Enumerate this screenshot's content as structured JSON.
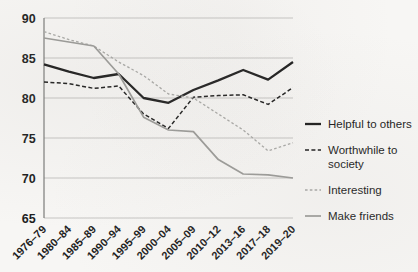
{
  "chart_data": {
    "type": "line",
    "title": "",
    "subtitle": "",
    "xlabel": "",
    "ylabel": "",
    "ylim": [
      65,
      90
    ],
    "yticks": [
      65,
      70,
      75,
      80,
      85,
      90
    ],
    "grid": true,
    "legend_position": "right",
    "categories": [
      "1976–79",
      "1980–84",
      "1985–89",
      "1990–94",
      "1995–99",
      "2000–04",
      "2005–09",
      "2010–12",
      "2013–16",
      "2017–18",
      "2019–20"
    ],
    "series": [
      {
        "name": "Helpful to others",
        "style": "solid",
        "color": "#1a1a1a",
        "width": 2.3,
        "values": [
          84.2,
          83.3,
          82.5,
          83.0,
          80.0,
          79.4,
          81.0,
          82.2,
          83.5,
          82.3,
          84.5
        ]
      },
      {
        "name": "Worthwhile to society",
        "style": "dashed",
        "color": "#1a1a1a",
        "width": 1.5,
        "values": [
          82.0,
          81.8,
          81.2,
          81.5,
          78.0,
          76.2,
          80.1,
          80.3,
          80.4,
          79.2,
          81.3
        ]
      },
      {
        "name": "Interesting",
        "style": "dotted",
        "color": "#a8a8a5",
        "width": 1.3,
        "values": [
          88.3,
          87.3,
          86.5,
          84.5,
          82.8,
          80.5,
          80.0,
          78.0,
          76.0,
          73.4,
          74.4
        ]
      },
      {
        "name": "Make friends",
        "style": "solid",
        "color": "#9a9a97",
        "width": 1.7,
        "values": [
          87.5,
          87.0,
          86.5,
          83.0,
          77.6,
          76.0,
          75.8,
          72.3,
          70.5,
          70.4,
          70.0
        ]
      }
    ]
  },
  "legend": {
    "items": [
      {
        "label": "Helpful to others",
        "label2": ""
      },
      {
        "label": "Worthwhile to",
        "label2": "society"
      },
      {
        "label": "Interesting",
        "label2": ""
      },
      {
        "label": "Make friends",
        "label2": ""
      }
    ]
  },
  "axis": {
    "y_labels": [
      "90",
      "85",
      "80",
      "75",
      "70",
      "65"
    ],
    "x_labels": [
      "1976–79",
      "1980–84",
      "1985–89",
      "1990–94",
      "1995–99",
      "2000–04",
      "2005–09",
      "2010–12",
      "2013–16",
      "2017–18",
      "2019–20"
    ]
  },
  "colors": {
    "background": "#f7f6f4",
    "grid": "#b9b9b6",
    "axis": "#6f6f6d",
    "dark_series": "#1a1a1a",
    "light_series": "#9a9a97",
    "lighter_series": "#a8a8a5",
    "text": "#1d1d1d"
  }
}
